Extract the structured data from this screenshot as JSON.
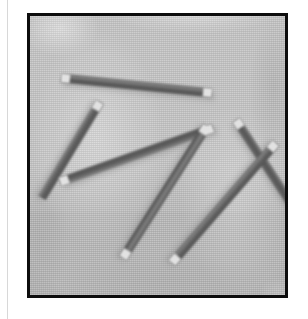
{
  "page": {
    "kind": "scanned-photograph-figure",
    "background_color": "#ffffff",
    "left_rule_color": "#d8d8d8"
  },
  "frame": {
    "label": "photo-frame",
    "border_color": "#0d0d0d",
    "border_width_px": 3,
    "left_px": 27,
    "top_px": 13,
    "width_px": 261,
    "height_px": 285
  },
  "photo": {
    "subject": "threaded rods scattered on a textured surface",
    "ground_upper_color": "#cdcdcd",
    "ground_lower_color": "#bebebe",
    "tone_break_y_px": 196,
    "texture": "halftone dither screen",
    "rod_body_color": "#6d6d6d",
    "rod_shadow_color": "#8f8f8f",
    "rod_tip_color": "#e2e2e2",
    "rod_count": 6,
    "rods": [
      {
        "name": "rod-top-horizontal",
        "x1": 31,
        "y1": 62,
        "x2": 182,
        "y2": 77,
        "thickness": 9,
        "tip_start": true,
        "tip_end": true
      },
      {
        "name": "rod-upper-left-diagonal",
        "x1": 70,
        "y1": 86,
        "x2": 12,
        "y2": 182,
        "thickness": 9,
        "tip_start": true,
        "tip_end": false
      },
      {
        "name": "rod-mid-left-diagonal",
        "x1": 30,
        "y1": 166,
        "x2": 183,
        "y2": 112,
        "thickness": 9,
        "tip_start": true,
        "tip_end": true
      },
      {
        "name": "rod-long-center-diagonal",
        "x1": 177,
        "y1": 110,
        "x2": 93,
        "y2": 242,
        "thickness": 9,
        "tip_start": true,
        "tip_end": true
      },
      {
        "name": "rod-right-upper-diagonal",
        "x1": 206,
        "y1": 104,
        "x2": 264,
        "y2": 192,
        "thickness": 9,
        "tip_start": true,
        "tip_end": false
      },
      {
        "name": "rod-right-crossing-diagonal",
        "x1": 246,
        "y1": 127,
        "x2": 142,
        "y2": 247,
        "thickness": 9,
        "tip_start": true,
        "tip_end": true
      }
    ]
  }
}
